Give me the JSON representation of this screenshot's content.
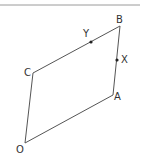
{
  "diagram": {
    "colors": {
      "line": "#555555",
      "top_rule": "#9a9a9a",
      "point": "#222222",
      "label": "#333333"
    },
    "top_rule": {
      "x1": 0,
      "y1": 5,
      "x2": 140,
      "y2": 5
    },
    "vertices": {
      "O": {
        "x": 25,
        "y": 143,
        "label": "O",
        "label_x": 16,
        "label_y": 153
      },
      "A": {
        "x": 113,
        "y": 95,
        "label": "A",
        "label_x": 114,
        "label_y": 100
      },
      "B": {
        "x": 120,
        "y": 26,
        "label": "B",
        "label_x": 116,
        "label_y": 23
      },
      "C": {
        "x": 33,
        "y": 73,
        "label": "C",
        "label_x": 24,
        "label_y": 76
      }
    },
    "points": {
      "X": {
        "x": 117,
        "y": 60,
        "label": "X",
        "label_x": 121,
        "label_y": 63
      },
      "Y": {
        "x": 91,
        "y": 42,
        "label": "Y",
        "label_x": 83,
        "label_y": 37
      }
    },
    "edges": [
      {
        "from": "O",
        "to": "A"
      },
      {
        "from": "A",
        "to": "B"
      },
      {
        "from": "B",
        "to": "C"
      },
      {
        "from": "C",
        "to": "O"
      }
    ]
  }
}
